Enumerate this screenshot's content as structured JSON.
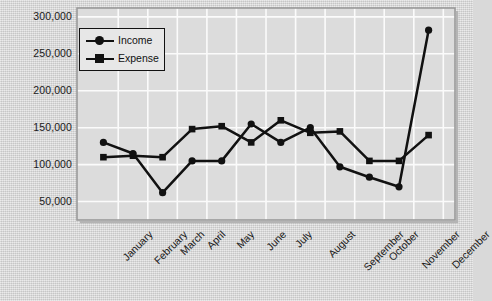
{
  "chart_data": {
    "type": "line",
    "title": "",
    "xlabel": "",
    "ylabel": "",
    "categories": [
      "January",
      "February",
      "March",
      "April",
      "May",
      "June",
      "July",
      "August",
      "September",
      "October",
      "November",
      "December"
    ],
    "series": [
      {
        "name": "Income",
        "marker": "circle",
        "color": "#111111",
        "values": [
          130000,
          115000,
          62000,
          105000,
          105000,
          155000,
          130000,
          150000,
          97000,
          83000,
          70000,
          282000
        ]
      },
      {
        "name": "Expense",
        "marker": "square",
        "color": "#111111",
        "values": [
          110000,
          112000,
          110000,
          148000,
          152000,
          130000,
          160000,
          143000,
          145000,
          105000,
          105000,
          140000
        ]
      }
    ],
    "ylim": [
      25000,
      312000
    ],
    "yticks": [
      50000,
      100000,
      150000,
      200000,
      250000,
      300000
    ],
    "ytick_labels": [
      "50,000",
      "100,000",
      "150,000",
      "200,000",
      "250,000",
      "300,000"
    ],
    "grid": true,
    "grid_color": "#ffffff",
    "legend_position": "upper-left",
    "plot_background": "#dcdcdc",
    "frame_color": "#8a8a8a"
  },
  "legend": {
    "items": [
      {
        "label": "Income"
      },
      {
        "label": "Expense"
      }
    ]
  },
  "axes": {
    "y_tick_labels": [
      "300,000",
      "250,000",
      "200,000",
      "150,000",
      "100,000",
      "50,000"
    ],
    "x_tick_labels": [
      "January",
      "February",
      "March",
      "April",
      "May",
      "June",
      "July",
      "August",
      "September",
      "October",
      "November",
      "December"
    ]
  }
}
